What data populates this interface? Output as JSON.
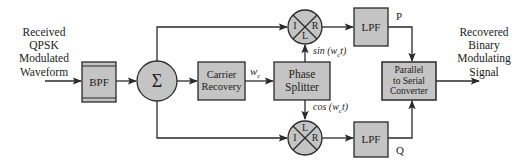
{
  "colors": {
    "block_fill": "#c4c4c4",
    "stroke": "#2a2a2a",
    "text": "#222222",
    "background": "#ffffff"
  },
  "input_label": {
    "lines": [
      "Received",
      "QPSK",
      "Modulated",
      "Waveform"
    ]
  },
  "output_label": {
    "lines": [
      "Recovered",
      "Binary",
      "Modulating",
      "Signal"
    ]
  },
  "blocks": {
    "bpf": {
      "label": "BPF"
    },
    "summer": {
      "symbol": "Σ"
    },
    "carrier_recovery": {
      "lines": [
        "Carrier",
        "Recovery"
      ]
    },
    "phase_splitter": {
      "lines": [
        "Phase",
        "Splitter"
      ]
    },
    "mixer_top": {
      "ports": {
        "left": "I",
        "right": "R",
        "bottom": "L"
      }
    },
    "mixer_bottom": {
      "ports": {
        "left": "I",
        "right": "R",
        "top": "L"
      }
    },
    "lpf_top": {
      "label": "LPF"
    },
    "lpf_bottom": {
      "label": "LPF"
    },
    "parallel_to_serial": {
      "lines": [
        "Parallel",
        "to Serial",
        "Converter"
      ]
    }
  },
  "signals": {
    "wc": "w",
    "wc_sub": "c",
    "sin": "sin (w",
    "sin_sub": "c",
    "sin_tail": "t)",
    "cos": "cos (w",
    "cos_sub": "c",
    "cos_tail": "t)",
    "p": "P",
    "q": "Q"
  }
}
